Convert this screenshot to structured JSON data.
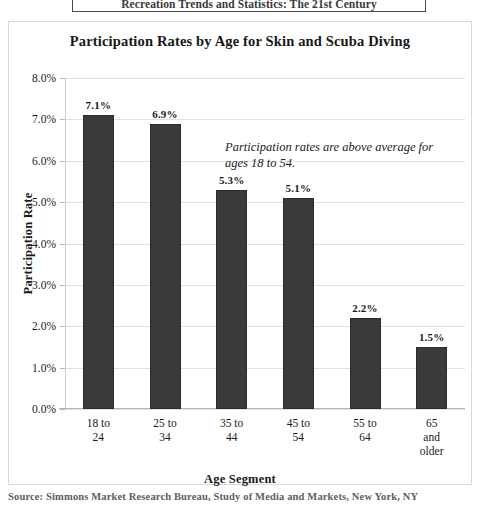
{
  "page_header": {
    "text": "Recreation Trends and Statistics: The 21st Century"
  },
  "chart_data": {
    "type": "bar",
    "title": "Participation Rates by Age for Skin and Scuba Diving",
    "xlabel": "Age Segment",
    "ylabel": "Participation Rate",
    "categories": [
      "18 to\n24",
      "25 to\n34",
      "35 to\n44",
      "45 to\n54",
      "55 to\n64",
      "65\nand\nolder"
    ],
    "values": [
      7.1,
      6.9,
      5.3,
      5.1,
      2.2,
      1.5
    ],
    "value_labels": [
      "7.1%",
      "6.9%",
      "5.3%",
      "5.1%",
      "2.2%",
      "1.5%"
    ],
    "ylim": [
      0,
      8
    ],
    "ytick_values": [
      0,
      1,
      2,
      3,
      4,
      5,
      6,
      7,
      8
    ],
    "ytick_labels": [
      "0.0%",
      "1.0%",
      "2.0%",
      "3.0%",
      "4.0%",
      "5.0%",
      "6.0%",
      "7.0%",
      "8.0%"
    ],
    "grid": true,
    "legend": "none",
    "bar_color": "#3a3a3a",
    "annotations": [
      "Participation rates are above average for ages 18 to 54."
    ]
  },
  "source": {
    "note": "Source: Simmons Market Research Bureau, Study of Media and Markets, New York, NY"
  }
}
